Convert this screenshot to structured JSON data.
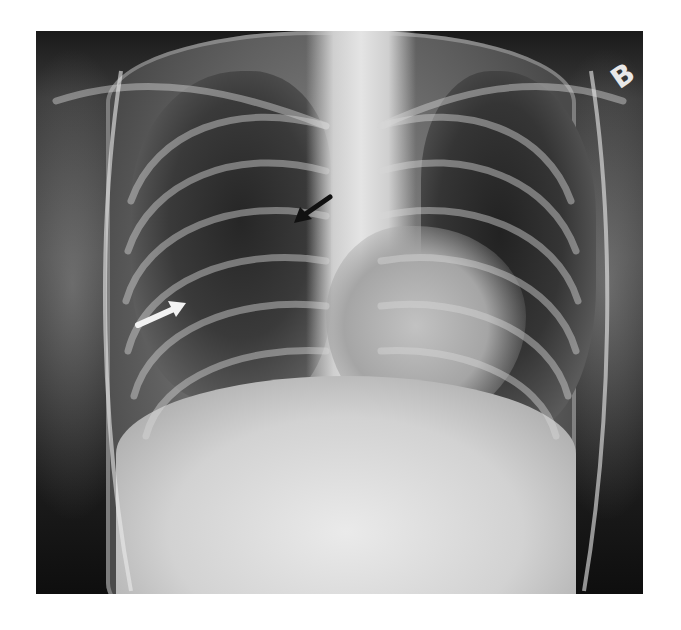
{
  "image": {
    "type": "Chest radiograph (frontal view)",
    "background_color": "#ffffff",
    "frame": {
      "x": 36,
      "y": 31,
      "width": 607,
      "height": 563
    }
  },
  "orientation_marker": {
    "label": "B",
    "color": "#e8e8e8"
  },
  "annotations": [
    {
      "id": "white-arrow",
      "color": "#f2f2f2",
      "direction": "pointing up-right",
      "tip": [
        180,
        306
      ],
      "tail": [
        140,
        322
      ]
    },
    {
      "id": "black-arrow",
      "color": "#111111",
      "direction": "pointing down-left",
      "tip": [
        296,
        217
      ],
      "tail": [
        327,
        198
      ]
    }
  ]
}
